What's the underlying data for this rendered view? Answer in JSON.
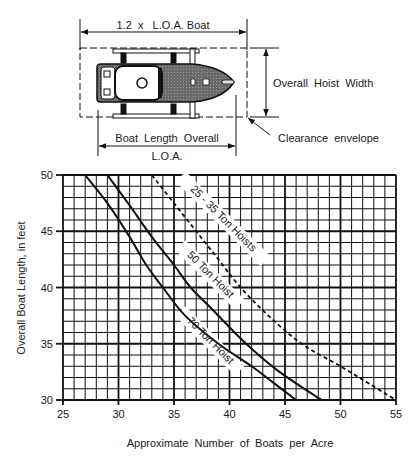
{
  "diagram": {
    "top_dimension_label": "1.2  x   L.O.A. Boat",
    "hoist_width_label": "Overall  Hoist  Width",
    "boat_length_label": "Boat  Length  Overall",
    "loa_label": "L.O.A.",
    "clearance_label": "Clearance  envelope"
  },
  "chart_data": {
    "type": "line",
    "title": "",
    "xlabel": "Approximate  Number  of  Boats  per  Acre",
    "ylabel": "Overall Boat Length, in feet",
    "xlim": [
      25,
      55
    ],
    "ylim": [
      30,
      50
    ],
    "x_ticks": [
      "25",
      "30",
      "35",
      "40",
      "45",
      "50",
      "55"
    ],
    "y_ticks": [
      "30",
      "35",
      "40",
      "45",
      "50"
    ],
    "grid": true,
    "grid_minor_step": 1,
    "grid_major_step": 5,
    "legend": "inline labels along curves",
    "series": [
      {
        "name": "70 Ton Hoist",
        "style": "solid",
        "points": [
          [
            27,
            50
          ],
          [
            29,
            47.5
          ],
          [
            31,
            44.5
          ],
          [
            32.5,
            42
          ],
          [
            34,
            40
          ],
          [
            36,
            37.5
          ],
          [
            39,
            35
          ],
          [
            42,
            33
          ],
          [
            44,
            31.5
          ],
          [
            46,
            30
          ]
        ]
      },
      {
        "name": "50 Ton Hoist",
        "style": "solid",
        "points": [
          [
            29,
            50
          ],
          [
            31,
            47.3
          ],
          [
            33,
            44.5
          ],
          [
            35,
            42
          ],
          [
            36.5,
            40
          ],
          [
            38.5,
            38
          ],
          [
            41.5,
            35
          ],
          [
            44.5,
            32.5
          ],
          [
            48.3,
            30
          ]
        ]
      },
      {
        "name": "25 - 35 Ton Hoists",
        "style": "dashed",
        "points": [
          [
            33,
            50
          ],
          [
            35,
            47.5
          ],
          [
            37,
            45
          ],
          [
            39,
            42.5
          ],
          [
            41,
            40
          ],
          [
            43.5,
            37.5
          ],
          [
            46.5,
            35
          ],
          [
            50,
            33
          ],
          [
            53,
            31.2
          ],
          [
            55,
            30
          ]
        ]
      }
    ]
  }
}
